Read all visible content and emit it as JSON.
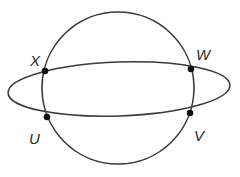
{
  "diagram": {
    "type": "geometry",
    "colors": {
      "stroke": "#3a3a3a",
      "point": "#111111",
      "label": "#2a2a2a",
      "background": "#ffffff"
    },
    "circle": {
      "cx": 118,
      "cy": 88,
      "r": 76
    },
    "ellipse": {
      "cx": 119,
      "cy": 89,
      "rx": 111,
      "ry": 27,
      "rotation": -2
    },
    "points": [
      {
        "id": "X",
        "label": "X",
        "x": 45,
        "y": 71,
        "label_x": 30,
        "label_y": 66
      },
      {
        "id": "W",
        "label": "W",
        "x": 191,
        "y": 69,
        "label_x": 196,
        "label_y": 60
      },
      {
        "id": "U",
        "label": "U",
        "x": 47,
        "y": 117,
        "label_x": 29,
        "label_y": 144
      },
      {
        "id": "V",
        "label": "V",
        "x": 190,
        "y": 113,
        "label_x": 194,
        "label_y": 141
      }
    ]
  }
}
